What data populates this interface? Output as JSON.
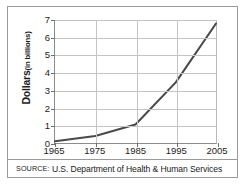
{
  "chart_data": {
    "type": "line",
    "title": "",
    "xlabel": "",
    "ylabel": "Dollars (in billions)",
    "ylabel_main": "Dollars",
    "ylabel_unit": "(in billions)",
    "x": [
      1965,
      1975,
      1985,
      1995,
      2005
    ],
    "values": [
      0.1,
      0.4,
      1.05,
      3.45,
      6.8
    ],
    "series": [
      {
        "name": "Dollars (in billions)",
        "values": [
          0.1,
          0.4,
          1.05,
          3.45,
          6.8
        ]
      }
    ],
    "xtick_labels": [
      "1965",
      "1975",
      "1985",
      "1995",
      "2005"
    ],
    "ytick_labels": [
      "0",
      "1",
      "2",
      "3",
      "4",
      "5",
      "6",
      "7"
    ],
    "ytick_values": [
      0,
      1,
      2,
      3,
      4,
      5,
      6,
      7
    ],
    "xlim": [
      1965,
      2005
    ],
    "ylim": [
      0,
      7
    ],
    "grid": true,
    "legend": false,
    "line_color": "#4a4a4a",
    "grid_color": "#c4c4c4",
    "axis_color": "#8c8c8c",
    "background_color": "#ffffff",
    "border_color": "#9a9a9a"
  },
  "source": {
    "keyword": "SOURCE:",
    "text": "U.S. Department of Health & Human Services"
  }
}
